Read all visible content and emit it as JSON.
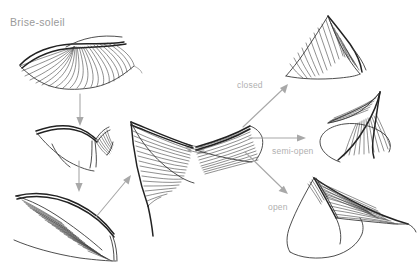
{
  "page": {
    "title": "Brise-soleil",
    "background_color": "#ffffff",
    "width": 420,
    "height": 278
  },
  "colors": {
    "title_text": "#9a9a9a",
    "label_text": "#b0b0b0",
    "sketch_ink": "#2b2b2b",
    "hatch_ink": "#333333",
    "arrow": "#a8a8a8"
  },
  "labels": {
    "closed": "closed",
    "semi_open": "semi-open",
    "open": "open"
  },
  "sketches": {
    "wing_open_top_left": "wing-open-fan-sketch",
    "wing_folded_mid_left": "wing-folded-sketch",
    "wing_curved_bottom_left": "wing-curved-hatched-sketch",
    "central_form": "central-hypar-louvre-sketch",
    "state_closed": "louvre-closed-sketch",
    "state_semi_open": "louvre-semi-open-sketch",
    "state_open": "louvre-open-sketch"
  },
  "arrows": {
    "top_left_down": "arrow-down",
    "mid_left_down": "arrow-down",
    "bottom_left_to_center": "arrow-up-right",
    "center_to_closed": "arrow-up-right",
    "center_to_semi_open": "arrow-right",
    "center_to_open": "arrow-down-right"
  }
}
